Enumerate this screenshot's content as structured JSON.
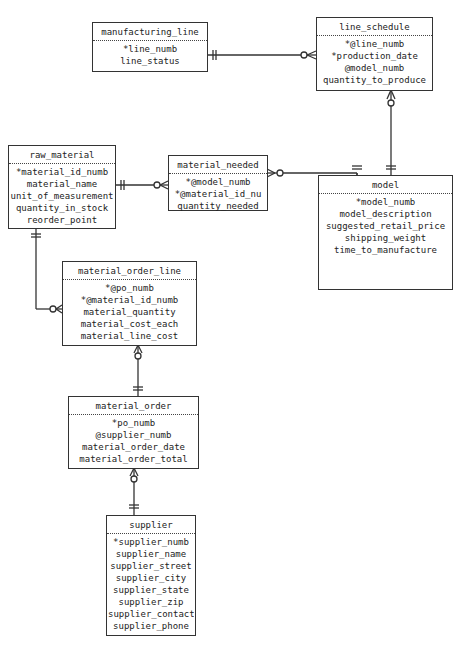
{
  "diagram": {
    "type": "entity-relationship",
    "entities": [
      {
        "name": "manufacturing_line",
        "attributes": [
          "*line_numb",
          "line_status"
        ]
      },
      {
        "name": "line_schedule",
        "attributes": [
          "*@line_numb",
          "*production_date",
          "@model_numb",
          "quantity_to_produce"
        ]
      },
      {
        "name": "raw_material",
        "attributes": [
          "*material_id_numb",
          "material_name",
          "unit_of_measurement",
          "quantity_in_stock",
          "reorder_point"
        ]
      },
      {
        "name": "material_needed",
        "attributes": [
          "*@model_numb",
          "*@material_id_nu",
          "quantity_needed"
        ]
      },
      {
        "name": "model",
        "attributes": [
          "*model_numb",
          "model_description",
          "suggested_retail_price",
          "shipping_weight",
          "time_to_manufacture"
        ]
      },
      {
        "name": "material_order_line",
        "attributes": [
          "*@po_numb",
          "*@material_id_numb",
          "material_quantity",
          "material_cost_each",
          "material_line_cost"
        ]
      },
      {
        "name": "material_order",
        "attributes": [
          "*po_numb",
          "@supplier_numb",
          "material_order_date",
          "material_order_total"
        ]
      },
      {
        "name": "supplier",
        "attributes": [
          "*supplier_numb",
          "supplier_name",
          "supplier_street",
          "supplier_city",
          "supplier_state",
          "supplier_zip",
          "supplier_contact",
          "supplier_phone"
        ]
      }
    ],
    "relationships": [
      {
        "from": "manufacturing_line",
        "from_cardinality": "exactly-one",
        "to": "line_schedule",
        "to_cardinality": "zero-or-many"
      },
      {
        "from": "model",
        "from_cardinality": "exactly-one",
        "to": "line_schedule",
        "to_cardinality": "zero-or-many"
      },
      {
        "from": "raw_material",
        "from_cardinality": "exactly-one",
        "to": "material_needed",
        "to_cardinality": "zero-or-many"
      },
      {
        "from": "model",
        "from_cardinality": "exactly-one",
        "to": "material_needed",
        "to_cardinality": "zero-or-many"
      },
      {
        "from": "raw_material",
        "from_cardinality": "exactly-one",
        "to": "material_order_line",
        "to_cardinality": "zero-or-many"
      },
      {
        "from": "material_order",
        "from_cardinality": "exactly-one",
        "to": "material_order_line",
        "to_cardinality": "zero-or-many"
      },
      {
        "from": "supplier",
        "from_cardinality": "exactly-one",
        "to": "material_order",
        "to_cardinality": "zero-or-many"
      }
    ],
    "colors": {
      "line": "#333333",
      "text": "#222222",
      "background": "#ffffff"
    }
  }
}
